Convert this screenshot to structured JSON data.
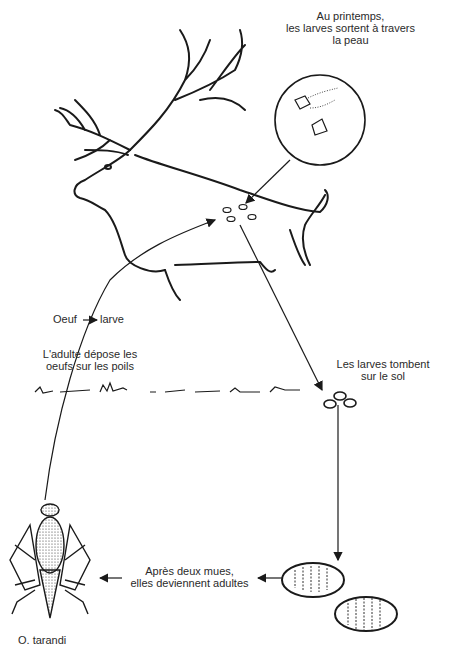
{
  "labels": {
    "spring": [
      "Au printemps,",
      "les larves sortent à travers",
      "la peau"
    ],
    "egg": "Oeuf",
    "larva": "larve",
    "adult_lays": [
      "L'adulte dépose les",
      "oeufs sur les poils"
    ],
    "larvae_fall": [
      "Les larves tombent",
      "sur le sol"
    ],
    "molts": [
      "Après deux mues,",
      "elles deviennent adultes"
    ],
    "species": "O. tarandi"
  },
  "figures": {
    "host": "caribou",
    "inset": "larvae-emerging-magnified",
    "pupae_count": 2,
    "larvae_on_ground_count": 3,
    "skin_holes_count": 4
  },
  "colors": {
    "ink": "#1a1a1a",
    "background": "#ffffff"
  }
}
